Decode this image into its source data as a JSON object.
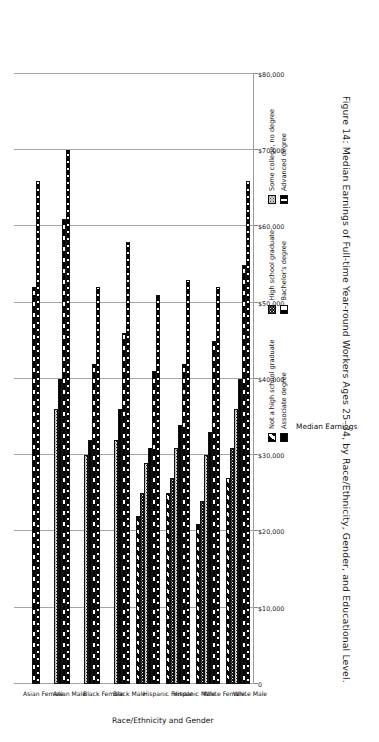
{
  "caption": "Figure 14: Median Earnings of Full-time Year-round Workers Ages 25–34, by Race/Ethnicity, Gender, and Educational Level.",
  "axis": {
    "value_axis_title": "Median Earnings",
    "category_axis_title": "Race/Ethnicity and Gender",
    "tick_labels": [
      "$80,000",
      "$70,000",
      "$60,000",
      "$50,000",
      "$40,000",
      "$30,000",
      "$20,000",
      "$10,000",
      "0"
    ]
  },
  "legend": {
    "column1": [
      {
        "label": "Not a high school graduate",
        "pattern": "diagonal-stripes"
      },
      {
        "label": "Associate degree",
        "pattern": "solid-black"
      }
    ],
    "column2": [
      {
        "label": "High school graduate",
        "pattern": "dense-dotted-dark"
      },
      {
        "label": "Bachelor's degree",
        "pattern": "black-white-squares"
      }
    ],
    "column3": [
      {
        "label": "Some college, no degree",
        "pattern": "light-dotted"
      },
      {
        "label": "Advanced degree",
        "pattern": "black-white-dashes"
      }
    ]
  },
  "chart_data": {
    "type": "bar",
    "orientation": "horizontal",
    "title": "Figure 14: Median Earnings of Full-time Year-round Workers Ages 25–34, by Race/Ethnicity, Gender, and Educational Level.",
    "xlabel": "Median Earnings",
    "ylabel": "Race/Ethnicity and Gender",
    "xlim": [
      0,
      80000
    ],
    "xticks": [
      0,
      10000,
      20000,
      30000,
      40000,
      50000,
      60000,
      70000,
      80000
    ],
    "grid": true,
    "legend_position": "bottom",
    "categories": [
      "Asian Female",
      "Asian Male",
      "Black Female",
      "Black Male",
      "Hispanic Female",
      "Hispanic Male",
      "White Female",
      "White Male"
    ],
    "series": [
      {
        "name": "Not a high school graduate",
        "values": [
          0,
          0,
          0,
          0,
          22000,
          25000,
          21000,
          27000
        ]
      },
      {
        "name": "High school graduate",
        "values": [
          0,
          0,
          0,
          0,
          25000,
          27000,
          24000,
          31000
        ]
      },
      {
        "name": "Some college, no degree",
        "values": [
          0,
          36000,
          30000,
          32000,
          29000,
          31000,
          30000,
          36000
        ]
      },
      {
        "name": "Associate degree",
        "values": [
          0,
          40000,
          32000,
          36000,
          31000,
          34000,
          33000,
          40000
        ]
      },
      {
        "name": "Bachelor's degree",
        "values": [
          52000,
          61000,
          42000,
          46000,
          41000,
          42000,
          45000,
          55000
        ]
      },
      {
        "name": "Advanced degree",
        "values": [
          66000,
          70000,
          52000,
          58000,
          51000,
          53000,
          52000,
          66000
        ]
      }
    ]
  }
}
